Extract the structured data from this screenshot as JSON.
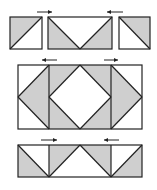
{
  "diagram": {
    "title": "",
    "colors": {
      "fill": "#cfcfcf",
      "stroke": "#222222",
      "background": "#ffffff"
    },
    "rows": [
      {
        "name": "top-row",
        "units": [
          {
            "name": "hst-left",
            "x": 10,
            "y": 17,
            "w": 32,
            "h": 32,
            "shapes": [
              {
                "points": "10,17 42,17 10,49"
              }
            ],
            "lines": [
              [
                42,
                17,
                10,
                49
              ]
            ]
          },
          {
            "name": "flying-geese-pair",
            "x": 48,
            "y": 17,
            "w": 64,
            "h": 32,
            "shapes": [
              {
                "points": "48,17 80,49 48,49"
              },
              {
                "points": "112,17 112,49 80,49"
              }
            ],
            "lines": [
              [
                48,
                17,
                80,
                49
              ],
              [
                80,
                49,
                112,
                17
              ]
            ]
          },
          {
            "name": "hst-right",
            "x": 119,
            "y": 17,
            "w": 31,
            "h": 32,
            "shapes": [
              {
                "points": "119,17 150,17 150,49"
              }
            ],
            "lines": [
              [
                119,
                17,
                150,
                49
              ]
            ]
          }
        ],
        "arrows": [
          {
            "x1": 37,
            "x2": 52,
            "y": 12,
            "dir": "right"
          },
          {
            "x1": 107,
            "x2": 123,
            "y": 12,
            "dir": "left"
          }
        ]
      },
      {
        "name": "middle-row",
        "x": 18,
        "y": 65,
        "w": 124,
        "h": 64,
        "dividers": [
          49,
          111
        ],
        "shapes": [
          {
            "points": "49,65 18,97 49,129"
          },
          {
            "points": "49,65 80,65 49,97"
          },
          {
            "points": "80,65 111,65 111,97"
          },
          {
            "points": "49,97 80,129 49,129"
          },
          {
            "points": "111,97 111,129 80,129"
          },
          {
            "points": "111,65 142,97 111,129"
          }
        ],
        "lines": [
          [
            49,
            65,
            18,
            97
          ],
          [
            18,
            97,
            49,
            129
          ],
          [
            80,
            65,
            49,
            97
          ],
          [
            49,
            97,
            80,
            129
          ],
          [
            80,
            129,
            111,
            97
          ],
          [
            111,
            97,
            80,
            65
          ],
          [
            111,
            65,
            142,
            97
          ],
          [
            142,
            97,
            111,
            129
          ]
        ],
        "arrows": [
          {
            "x1": 42,
            "x2": 57,
            "y": 60,
            "dir": "left"
          },
          {
            "x1": 104,
            "x2": 118,
            "y": 60,
            "dir": "right"
          }
        ]
      },
      {
        "name": "bottom-row",
        "x": 18,
        "y": 145,
        "w": 124,
        "h": 32,
        "dividers": [
          49,
          111
        ],
        "shapes": [
          {
            "points": "18,145 49,177 18,177"
          },
          {
            "points": "49,145 80,145 49,177"
          },
          {
            "points": "80,145 111,145 111,177"
          },
          {
            "points": "142,145 142,177 111,177"
          }
        ],
        "lines": [
          [
            18,
            145,
            49,
            177
          ],
          [
            49,
            177,
            80,
            145
          ],
          [
            80,
            145,
            111,
            177
          ],
          [
            111,
            177,
            142,
            145
          ]
        ],
        "arrows": [
          {
            "x1": 41,
            "x2": 57,
            "y": 140,
            "dir": "right"
          },
          {
            "x1": 104,
            "x2": 119,
            "y": 140,
            "dir": "left"
          }
        ]
      }
    ]
  }
}
